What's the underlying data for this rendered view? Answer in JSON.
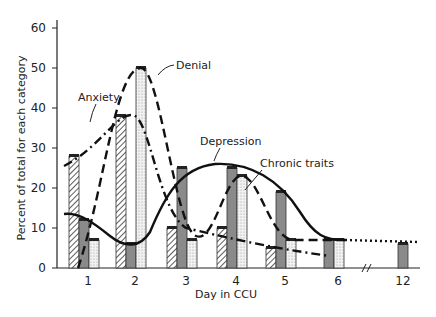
{
  "chart_data": {
    "type": "bar",
    "title": "",
    "xlabel": "Day in CCU",
    "ylabel": "Percent of total for each category",
    "ylim": [
      0,
      60
    ],
    "yticks": [
      0,
      10,
      20,
      30,
      40,
      50,
      60
    ],
    "categories": [
      "1",
      "2",
      "3",
      "4",
      "5",
      "6",
      "12"
    ],
    "axis_break_between": [
      "6",
      "12"
    ],
    "grid": false,
    "legend": "inline curve labels",
    "series": [
      {
        "name": "Anxiety",
        "pattern": "hatched",
        "line_style": "dash-dot",
        "values": [
          28,
          38,
          10,
          10,
          5,
          null,
          null
        ],
        "curve_end": 2
      },
      {
        "name": "Depression",
        "pattern": "dark-gray",
        "line_style": "solid",
        "values": [
          12,
          6,
          25,
          25,
          19,
          7,
          6
        ]
      },
      {
        "name": "Denial",
        "pattern": "dotted",
        "line_style": "long-dash",
        "values": [
          7,
          50,
          7,
          23,
          7,
          7,
          null
        ]
      },
      {
        "name": "Chronic traits",
        "pattern": "none",
        "line_style": "dashed then dotted",
        "values": [
          null,
          null,
          null,
          23,
          7,
          7,
          6
        ]
      }
    ],
    "annotations": [
      {
        "text": "Anxiety",
        "near_day": "1.5"
      },
      {
        "text": "Denial",
        "near_day": "2"
      },
      {
        "text": "Depression",
        "near_day": "4"
      },
      {
        "text": "Chronic traits",
        "near_day": "4.5"
      }
    ]
  }
}
